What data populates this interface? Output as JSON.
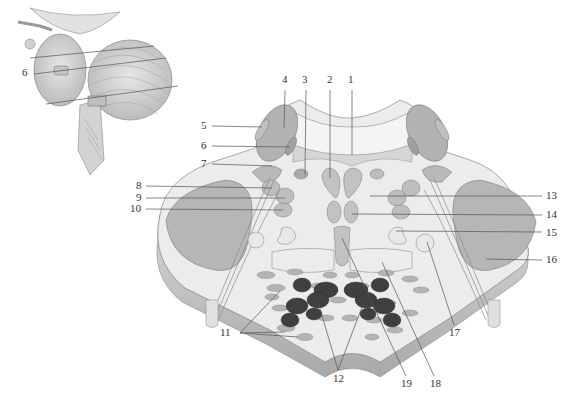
{
  "diagram": {
    "inset": {
      "name": "brainstem-cerebellum-lateral-view",
      "labels": [
        {
          "id": "inset-6",
          "text": "6",
          "x": 22,
          "y": 72
        }
      ]
    },
    "colors": {
      "background": "#ffffff",
      "tissue_light": "#e9e9e9",
      "tissue_mid": "#c9c9c9",
      "nucleus_fill": "#a9a9a9",
      "nucleus_dark": "#3e3e3e",
      "outline": "#6f6f6f",
      "leader_line": "#555555",
      "label_text": "#333333"
    },
    "labels": [
      {
        "id": "1",
        "text": "1",
        "x": 348,
        "y": 80
      },
      {
        "id": "2",
        "text": "2",
        "x": 327,
        "y": 80
      },
      {
        "id": "3",
        "text": "3",
        "x": 302,
        "y": 80
      },
      {
        "id": "4",
        "text": "4",
        "x": 282,
        "y": 80
      },
      {
        "id": "5",
        "text": "5",
        "x": 203,
        "y": 125
      },
      {
        "id": "6",
        "text": "6",
        "x": 203,
        "y": 145
      },
      {
        "id": "7",
        "text": "7",
        "x": 203,
        "y": 163
      },
      {
        "id": "8",
        "text": "8",
        "x": 136,
        "y": 185
      },
      {
        "id": "9",
        "text": "9",
        "x": 136,
        "y": 197
      },
      {
        "id": "10",
        "text": "10",
        "x": 131,
        "y": 208
      },
      {
        "id": "11",
        "text": "11",
        "x": 219,
        "y": 332
      },
      {
        "id": "12",
        "text": "12",
        "x": 334,
        "y": 378
      },
      {
        "id": "13",
        "text": "13",
        "x": 547,
        "y": 195
      },
      {
        "id": "14",
        "text": "14",
        "x": 547,
        "y": 214
      },
      {
        "id": "15",
        "text": "15",
        "x": 547,
        "y": 232
      },
      {
        "id": "16",
        "text": "16",
        "x": 547,
        "y": 259
      },
      {
        "id": "17",
        "text": "17",
        "x": 450,
        "y": 332
      },
      {
        "id": "18",
        "text": "18",
        "x": 432,
        "y": 383
      },
      {
        "id": "19",
        "text": "19",
        "x": 403,
        "y": 383
      }
    ]
  }
}
